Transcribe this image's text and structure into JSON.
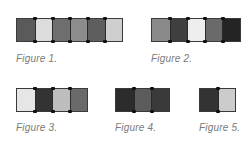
{
  "figures": [
    {
      "caption": "Figure 1.",
      "swatches": [
        "#5a5a5a",
        "#dcdcdc",
        "#6e6e6e",
        "#8c8c8c",
        "#5e5e5e",
        "#cfcfcf"
      ]
    },
    {
      "caption": "Figure 2.",
      "swatches": [
        "#8a8a8a",
        "#3f3f3f",
        "#eeeeee",
        "#6a6a6a",
        "#242424"
      ]
    },
    {
      "caption": "Figure 3.",
      "swatches": [
        "#e6e6e6",
        "#333333",
        "#bdbdbd",
        "#6a6a6a"
      ]
    },
    {
      "caption": "Figure 4.",
      "swatches": [
        "#2c2c2c",
        "#5c5c5c",
        "#3a3a3a"
      ]
    },
    {
      "caption": "Figure 5.",
      "swatches": [
        "#333333",
        "#cccccc"
      ]
    }
  ]
}
